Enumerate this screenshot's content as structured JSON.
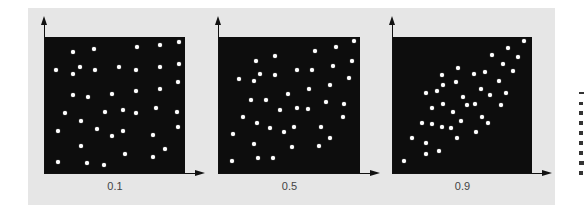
{
  "chart_data": [
    {
      "type": "scatter",
      "title": "",
      "label": "0.1",
      "xlabel": "",
      "ylabel": "",
      "xlim": [
        0,
        1
      ],
      "ylim": [
        0,
        1
      ],
      "grid": false,
      "colors": {
        "background": "#0d0d0d",
        "point": "#ffffff"
      },
      "points": [
        [
          0.2,
          0.89
        ],
        [
          0.35,
          0.91
        ],
        [
          0.66,
          0.93
        ],
        [
          0.82,
          0.94
        ],
        [
          0.96,
          0.96
        ],
        [
          0.08,
          0.76
        ],
        [
          0.25,
          0.78
        ],
        [
          0.2,
          0.73
        ],
        [
          0.36,
          0.76
        ],
        [
          0.53,
          0.78
        ],
        [
          0.65,
          0.76
        ],
        [
          0.82,
          0.78
        ],
        [
          0.96,
          0.8
        ],
        [
          0.95,
          0.67
        ],
        [
          0.2,
          0.57
        ],
        [
          0.31,
          0.56
        ],
        [
          0.48,
          0.58
        ],
        [
          0.65,
          0.6
        ],
        [
          0.82,
          0.62
        ],
        [
          0.14,
          0.44
        ],
        [
          0.43,
          0.45
        ],
        [
          0.56,
          0.46
        ],
        [
          0.65,
          0.44
        ],
        [
          0.79,
          0.48
        ],
        [
          0.94,
          0.45
        ],
        [
          0.26,
          0.38
        ],
        [
          0.09,
          0.31
        ],
        [
          0.37,
          0.32
        ],
        [
          0.48,
          0.27
        ],
        [
          0.56,
          0.31
        ],
        [
          0.77,
          0.28
        ],
        [
          0.95,
          0.34
        ],
        [
          0.26,
          0.2
        ],
        [
          0.57,
          0.14
        ],
        [
          0.86,
          0.18
        ],
        [
          0.77,
          0.12
        ],
        [
          0.09,
          0.08
        ],
        [
          0.3,
          0.07
        ],
        [
          0.42,
          0.06
        ]
      ]
    },
    {
      "type": "scatter",
      "title": "",
      "label": "0.5",
      "xlabel": "",
      "ylabel": "",
      "xlim": [
        0,
        1
      ],
      "ylim": [
        0,
        1
      ],
      "grid": false,
      "colors": {
        "background": "#0d0d0d",
        "point": "#ffffff"
      },
      "points": [
        [
          0.96,
          0.97
        ],
        [
          0.83,
          0.93
        ],
        [
          0.68,
          0.9
        ],
        [
          0.4,
          0.86
        ],
        [
          0.26,
          0.82
        ],
        [
          0.94,
          0.82
        ],
        [
          0.81,
          0.79
        ],
        [
          0.55,
          0.76
        ],
        [
          0.66,
          0.76
        ],
        [
          0.29,
          0.73
        ],
        [
          0.4,
          0.72
        ],
        [
          0.92,
          0.7
        ],
        [
          0.14,
          0.69
        ],
        [
          0.25,
          0.68
        ],
        [
          0.79,
          0.65
        ],
        [
          0.64,
          0.62
        ],
        [
          0.49,
          0.58
        ],
        [
          0.23,
          0.54
        ],
        [
          0.33,
          0.54
        ],
        [
          0.76,
          0.52
        ],
        [
          0.89,
          0.51
        ],
        [
          0.55,
          0.48
        ],
        [
          0.63,
          0.47
        ],
        [
          0.43,
          0.46
        ],
        [
          0.17,
          0.41
        ],
        [
          0.88,
          0.41
        ],
        [
          0.27,
          0.37
        ],
        [
          0.53,
          0.34
        ],
        [
          0.72,
          0.34
        ],
        [
          0.36,
          0.33
        ],
        [
          0.46,
          0.3
        ],
        [
          0.1,
          0.29
        ],
        [
          0.79,
          0.26
        ],
        [
          0.25,
          0.21
        ],
        [
          0.52,
          0.19
        ],
        [
          0.71,
          0.2
        ],
        [
          0.09,
          0.09
        ],
        [
          0.28,
          0.11
        ],
        [
          0.38,
          0.11
        ]
      ]
    },
    {
      "type": "scatter",
      "title": "",
      "label": "0.9",
      "xlabel": "",
      "ylabel": "",
      "xlim": [
        0,
        1
      ],
      "ylim": [
        0,
        1
      ],
      "grid": false,
      "colors": {
        "background": "#0d0d0d",
        "point": "#ffffff"
      },
      "points": [
        [
          0.94,
          0.97
        ],
        [
          0.83,
          0.92
        ],
        [
          0.71,
          0.87
        ],
        [
          0.9,
          0.85
        ],
        [
          0.79,
          0.8
        ],
        [
          0.47,
          0.77
        ],
        [
          0.86,
          0.75
        ],
        [
          0.66,
          0.74
        ],
        [
          0.58,
          0.73
        ],
        [
          0.35,
          0.72
        ],
        [
          0.76,
          0.68
        ],
        [
          0.45,
          0.67
        ],
        [
          0.36,
          0.65
        ],
        [
          0.63,
          0.62
        ],
        [
          0.32,
          0.6
        ],
        [
          0.24,
          0.59
        ],
        [
          0.81,
          0.59
        ],
        [
          0.7,
          0.57
        ],
        [
          0.5,
          0.56
        ],
        [
          0.36,
          0.51
        ],
        [
          0.53,
          0.5
        ],
        [
          0.59,
          0.51
        ],
        [
          0.78,
          0.5
        ],
        [
          0.28,
          0.48
        ],
        [
          0.43,
          0.45
        ],
        [
          0.64,
          0.41
        ],
        [
          0.49,
          0.38
        ],
        [
          0.21,
          0.37
        ],
        [
          0.68,
          0.37
        ],
        [
          0.28,
          0.36
        ],
        [
          0.35,
          0.34
        ],
        [
          0.42,
          0.33
        ],
        [
          0.6,
          0.3
        ],
        [
          0.46,
          0.26
        ],
        [
          0.14,
          0.26
        ],
        [
          0.24,
          0.22
        ],
        [
          0.33,
          0.16
        ],
        [
          0.24,
          0.14
        ],
        [
          0.08,
          0.09
        ]
      ]
    }
  ],
  "panels": [
    {
      "label": "0.1"
    },
    {
      "label": "0.5"
    },
    {
      "label": "0.9"
    }
  ]
}
